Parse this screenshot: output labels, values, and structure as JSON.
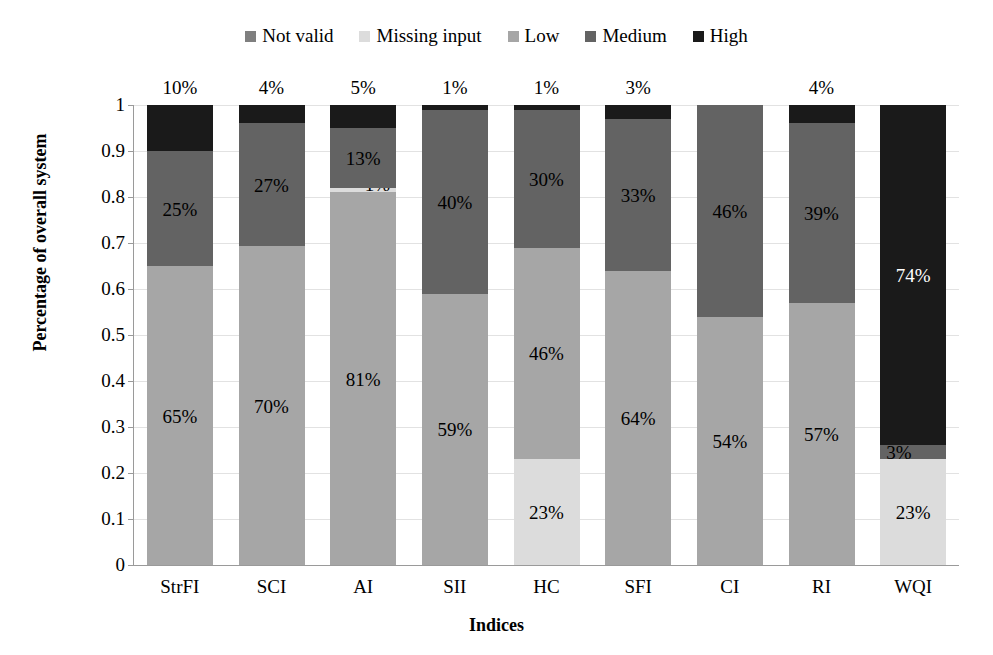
{
  "chart_data": {
    "type": "bar",
    "subtype": "stacked-bar-100",
    "title": "",
    "xlabel": "Indices",
    "ylabel": "Percentage of overall system",
    "ylim": [
      0,
      1
    ],
    "yticks": [
      "0",
      "0.1",
      "0.2",
      "0.3",
      "0.4",
      "0.5",
      "0.6",
      "0.7",
      "0.8",
      "0.9",
      "1"
    ],
    "grid": true,
    "legend_position": "top-center",
    "legend": [
      "Not valid",
      "Missing input",
      "Low",
      "Medium",
      "High"
    ],
    "colors": {
      "Not valid": "#7f7f7f",
      "Missing input": "#dcdcdc",
      "Low": "#a6a6a6",
      "Medium": "#636363",
      "High": "#1a1a1a",
      "gridline": "#e2e2e2",
      "axis": "#9a9a9a"
    },
    "categories": [
      "StrFI",
      "SCI",
      "AI",
      "SII",
      "HC",
      "SFI",
      "CI",
      "RI",
      "WQI"
    ],
    "series": [
      {
        "name": "Not valid",
        "values": [
          0,
          0,
          0,
          0,
          0,
          0,
          0,
          0,
          0
        ]
      },
      {
        "name": "Missing input",
        "values": [
          0,
          0,
          1,
          0,
          23,
          0,
          0,
          0,
          23
        ]
      },
      {
        "name": "Low",
        "values": [
          65,
          70,
          81,
          59,
          46,
          64,
          54,
          57,
          0
        ]
      },
      {
        "name": "Medium",
        "values": [
          25,
          27,
          13,
          40,
          30,
          33,
          46,
          39,
          3
        ]
      },
      {
        "name": "High",
        "values": [
          10,
          4,
          5,
          1,
          1,
          3,
          0,
          4,
          74
        ]
      }
    ],
    "bars": [
      {
        "category": "StrFI",
        "top_label": "10%",
        "segments": [
          {
            "series": "Low",
            "value": 65,
            "label": "65%",
            "show_label": true
          },
          {
            "series": "Medium",
            "value": 25,
            "label": "25%",
            "show_label": true
          },
          {
            "series": "High",
            "value": 10,
            "label": "10%",
            "show_label": false
          }
        ]
      },
      {
        "category": "SCI",
        "top_label": "4%",
        "segments": [
          {
            "series": "Low",
            "value": 70,
            "label": "70%",
            "show_label": true
          },
          {
            "series": "Medium",
            "value": 27,
            "label": "27%",
            "show_label": true
          },
          {
            "series": "High",
            "value": 4,
            "label": "4%",
            "show_label": false
          }
        ]
      },
      {
        "category": "AI",
        "top_label": "5%",
        "segments": [
          {
            "series": "Low",
            "value": 81,
            "label": "81%",
            "show_label": true
          },
          {
            "series": "Missing input",
            "value": 1,
            "label": "1%",
            "show_label": true
          },
          {
            "series": "Medium",
            "value": 13,
            "label": "13%",
            "show_label": true
          },
          {
            "series": "High",
            "value": 5,
            "label": "5%",
            "show_label": false
          }
        ]
      },
      {
        "category": "SII",
        "top_label": "1%",
        "segments": [
          {
            "series": "Low",
            "value": 59,
            "label": "59%",
            "show_label": true
          },
          {
            "series": "Medium",
            "value": 40,
            "label": "40%",
            "show_label": true
          },
          {
            "series": "High",
            "value": 1,
            "label": "1%",
            "show_label": false
          }
        ]
      },
      {
        "category": "HC",
        "top_label": "1%",
        "segments": [
          {
            "series": "Missing input",
            "value": 23,
            "label": "23%",
            "show_label": true
          },
          {
            "series": "Low",
            "value": 46,
            "label": "46%",
            "show_label": true
          },
          {
            "series": "Medium",
            "value": 30,
            "label": "30%",
            "show_label": true
          },
          {
            "series": "High",
            "value": 1,
            "label": "1%",
            "show_label": false
          }
        ]
      },
      {
        "category": "SFI",
        "top_label": "3%",
        "segments": [
          {
            "series": "Low",
            "value": 64,
            "label": "64%",
            "show_label": true
          },
          {
            "series": "Medium",
            "value": 33,
            "label": "33%",
            "show_label": true
          },
          {
            "series": "High",
            "value": 3,
            "label": "3%",
            "show_label": false
          }
        ]
      },
      {
        "category": "CI",
        "top_label": "",
        "segments": [
          {
            "series": "Low",
            "value": 54,
            "label": "54%",
            "show_label": true
          },
          {
            "series": "Medium",
            "value": 46,
            "label": "46%",
            "show_label": true
          }
        ]
      },
      {
        "category": "RI",
        "top_label": "4%",
        "segments": [
          {
            "series": "Low",
            "value": 57,
            "label": "57%",
            "show_label": true
          },
          {
            "series": "Medium",
            "value": 39,
            "label": "39%",
            "show_label": true
          },
          {
            "series": "High",
            "value": 4,
            "label": "4%",
            "show_label": false
          }
        ]
      },
      {
        "category": "WQI",
        "top_label": "",
        "segments": [
          {
            "series": "Missing input",
            "value": 23,
            "label": "23%",
            "show_label": true
          },
          {
            "series": "Medium",
            "value": 3,
            "label": "3%",
            "show_label": true
          },
          {
            "series": "High",
            "value": 74,
            "label": "74%",
            "show_label": true
          }
        ]
      }
    ]
  }
}
